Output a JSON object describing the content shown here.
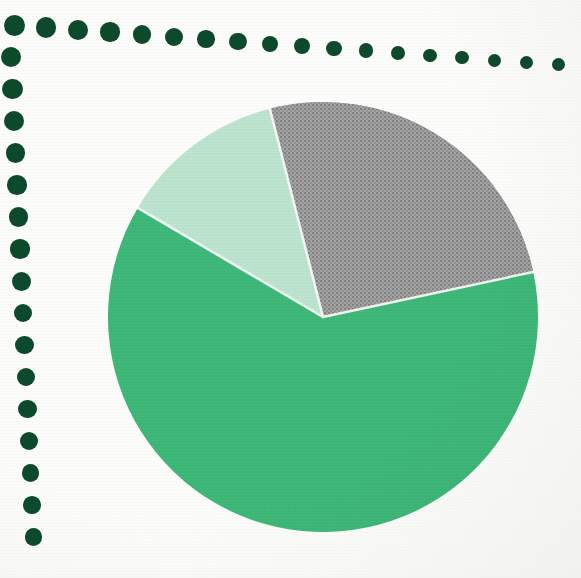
{
  "canvas": {
    "width": 581,
    "height": 578,
    "background_color": "#fcfcfa"
  },
  "decoration": {
    "name": "dot-border",
    "color": "#0d4a2c",
    "top_row": {
      "count": 18,
      "start_x": 14,
      "start_y": 25,
      "step_x": 32.0,
      "step_y": 2.35,
      "radius": 10.5,
      "radius_falloff": 0.28
    },
    "left_column": {
      "count": 16,
      "start_x": 11,
      "start_y": 57,
      "step_x": 1.5,
      "step_y": 32.0,
      "radius": 10.2,
      "radius_falloff": 0.1
    }
  },
  "chart_data": {
    "type": "pie",
    "title": "",
    "subtitle": "",
    "xlabel": "",
    "ylabel": "",
    "legend_position": "none",
    "grid": false,
    "center_x": 323,
    "center_y": 317,
    "radius": 215,
    "start_angle_deg": 345.7,
    "direction": "clockwise",
    "separator_color": "#fdfdfb",
    "separator_width": 2.5,
    "categories": [
      "Segment A",
      "Segment B",
      "Segment C"
    ],
    "values": [
      25.6,
      61.8,
      12.6
    ],
    "labels": [
      "",
      "",
      ""
    ],
    "colors": [
      "#9a9a9a",
      "#3cb878",
      "#bce4cf"
    ],
    "slices": [
      {
        "name": "Segment A",
        "value": 25.6,
        "angle_deg": 92.2,
        "start_deg": 345.7,
        "end_deg": 77.9,
        "color": "#9a9a9a",
        "texture": "halftone-coarse"
      },
      {
        "name": "Segment B",
        "value": 61.8,
        "angle_deg": 222.6,
        "start_deg": 77.9,
        "end_deg": 300.5,
        "color": "#3cb878",
        "texture": "halftone-fine"
      },
      {
        "name": "Segment C",
        "value": 12.6,
        "angle_deg": 45.2,
        "start_deg": 300.5,
        "end_deg": 345.7,
        "color": "#bce4cf",
        "texture": "halftone-fine"
      }
    ]
  }
}
